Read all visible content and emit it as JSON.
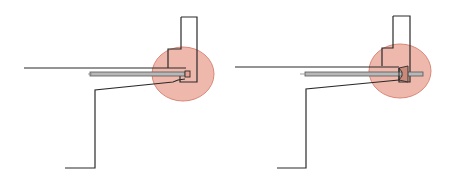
{
  "diagram": {
    "colors": {
      "line": "#2a2a2a",
      "highlight_fill": "#e8a090",
      "highlight_stroke": "#d98878",
      "rod_fill": "#b8b8b8",
      "detail_fill": "#c98a7a"
    },
    "panels": [
      {
        "id": "left",
        "variant": "rod-with-bolt-head"
      },
      {
        "id": "right",
        "variant": "rod-with-wedge-anchor"
      }
    ]
  }
}
